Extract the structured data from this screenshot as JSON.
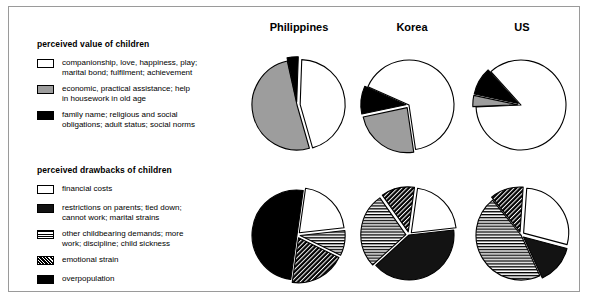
{
  "legends": [
    {
      "id": "perceived-value",
      "title": "perceived value of children",
      "items": [
        {
          "key": "companionship",
          "pattern": "white",
          "label": "companionship, love, happiness, play;\nmarital bond; fulfilment; achievement"
        },
        {
          "key": "economic",
          "pattern": "gray",
          "label": "economic, practical assistance; help\nin housework in old age"
        },
        {
          "key": "family-name",
          "pattern": "black",
          "label": "family name; religious and social\nobligations; adult status; social norms"
        }
      ]
    },
    {
      "id": "perceived-drawbacks",
      "title": "perceived drawbacks of children",
      "items": [
        {
          "key": "financial-costs",
          "pattern": "white",
          "label": "financial costs"
        },
        {
          "key": "restrictions",
          "pattern": "dark",
          "label": "restrictions on parents; tied down;\ncannot work; marital strains"
        },
        {
          "key": "childbearing",
          "pattern": "hstripe",
          "label": "other childbearing demands; more\nwork; discipline; child sickness"
        },
        {
          "key": "emotional-strain",
          "pattern": "diag",
          "label": "emotional strain"
        },
        {
          "key": "overpopulation",
          "pattern": "black",
          "label": "overpopulation"
        }
      ]
    }
  ],
  "columns": [
    {
      "key": "philippines",
      "label": "Philippines"
    },
    {
      "key": "korea",
      "label": "Korea"
    },
    {
      "key": "us",
      "label": "US"
    }
  ],
  "chart_data": {
    "type": "pie",
    "legend_position": "left",
    "grid": false,
    "charts": [
      {
        "id": "ph-value",
        "row": "perceived value of children",
        "country": "Philippines",
        "categories": [
          "companionship",
          "economic",
          "family name"
        ],
        "values": [
          45,
          51,
          4
        ],
        "unit": "percent",
        "patterns": [
          "white",
          "gray",
          "black"
        ],
        "exploded": [
          "companionship",
          "family name"
        ]
      },
      {
        "id": "kr-value",
        "row": "perceived value of children",
        "country": "Korea",
        "categories": [
          "companionship",
          "economic",
          "family name"
        ],
        "values": [
          66,
          24,
          10
        ],
        "unit": "percent",
        "patterns": [
          "white",
          "gray",
          "black"
        ],
        "exploded": [
          "economic",
          "family name"
        ]
      },
      {
        "id": "us-value",
        "row": "perceived value of children",
        "country": "US",
        "categories": [
          "companionship",
          "economic",
          "family name"
        ],
        "values": [
          86,
          4,
          10
        ],
        "unit": "percent",
        "patterns": [
          "white",
          "gray",
          "black"
        ],
        "exploded": [
          "economic",
          "family name"
        ]
      },
      {
        "id": "ph-draw",
        "row": "perceived drawbacks of children",
        "country": "Philippines",
        "categories": [
          "financial costs",
          "restrictions on parents",
          "other childbearing demands",
          "emotional strain",
          "overpopulation"
        ],
        "values": [
          21,
          0,
          9,
          20,
          50
        ],
        "unit": "percent",
        "patterns": [
          "white",
          "dark",
          "hstripe",
          "diag",
          "black"
        ],
        "exploded": [
          "financial costs",
          "other childbearing demands",
          "emotional strain"
        ]
      },
      {
        "id": "kr-draw",
        "row": "perceived drawbacks of children",
        "country": "Korea",
        "categories": [
          "financial costs",
          "restrictions on parents",
          "other childbearing demands",
          "emotional strain",
          "overpopulation"
        ],
        "values": [
          21,
          40,
          27,
          12,
          0
        ],
        "unit": "percent",
        "patterns": [
          "white",
          "dark",
          "hstripe",
          "diag",
          "black"
        ],
        "exploded": [
          "financial costs",
          "other childbearing demands",
          "emotional strain"
        ]
      },
      {
        "id": "us-draw",
        "row": "perceived drawbacks of children",
        "country": "US",
        "categories": [
          "financial costs",
          "restrictions on parents",
          "other childbearing demands",
          "emotional strain",
          "overpopulation"
        ],
        "values": [
          28,
          14,
          46,
          12,
          0
        ],
        "unit": "percent",
        "patterns": [
          "white",
          "dark",
          "hstripe",
          "diag",
          "black"
        ],
        "exploded": [
          "financial costs",
          "restrictions on parents",
          "emotional strain"
        ]
      }
    ]
  }
}
